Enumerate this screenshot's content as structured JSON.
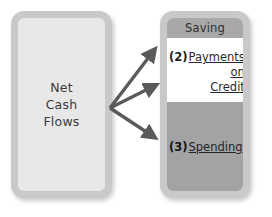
{
  "diagram": {
    "title_text": "Net Cash Flows allocation",
    "source": {
      "label": "Net\nCash\nFlows",
      "fill_color": "#e8e8e8",
      "frame_color": "#c9c9c9"
    },
    "destinations": {
      "frame_color": "#c9c9c9",
      "bands": [
        {
          "number": "",
          "label": "Saving",
          "underlined": false,
          "fill_color": "#a8a8a8",
          "text_color": "#2e2e2e"
        },
        {
          "number": "(2)",
          "label_lines": [
            "Payments",
            "on",
            "Credit"
          ],
          "underlined": true,
          "fill_color": "#ffffff",
          "text_color": "#2a2a2a"
        },
        {
          "number": "(3)",
          "label": "Spending",
          "underlined": true,
          "fill_color": "#a3a3a3",
          "text_color": "#232323"
        }
      ]
    },
    "arrows": {
      "color": "#5a5a5a",
      "count": 3,
      "origin": {
        "x": 110,
        "y": 108
      },
      "tips": [
        {
          "x": 157,
          "y": 47,
          "target": "Saving"
        },
        {
          "x": 158,
          "y": 85,
          "target": "Payments on Credit"
        },
        {
          "x": 157,
          "y": 140,
          "target": "Spending"
        }
      ]
    }
  }
}
